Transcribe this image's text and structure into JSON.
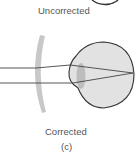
{
  "labels": {
    "top": "Uncorrected",
    "bottom": "Corrected",
    "caption": "(c)"
  },
  "colors": {
    "eye_fill": "#e2e2e2",
    "eye_stroke": "#333333",
    "lens_fill": "#c8c8c8",
    "crystalline_lens": "#bdbdbd",
    "ray": "#444444",
    "text": "#555555"
  }
}
